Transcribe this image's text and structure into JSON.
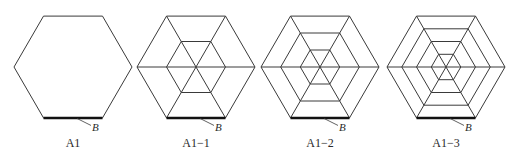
{
  "figure": {
    "panels": [
      {
        "id": "A1",
        "label": "A1",
        "cx": 73,
        "rings": 1,
        "edge_label": "B"
      },
      {
        "id": "A1-1",
        "label": "A1−1",
        "cx": 196,
        "rings": 2,
        "edge_label": "B"
      },
      {
        "id": "A1-2",
        "label": "A1−2",
        "cx": 320,
        "rings": 3,
        "edge_label": "B"
      },
      {
        "id": "A1-3",
        "label": "A1−3",
        "cx": 446,
        "rings": 4,
        "edge_label": "B"
      }
    ],
    "hexagon": {
      "radius": 59,
      "cy": 67,
      "spokes_except_first": true
    },
    "colors": {
      "line": "#3a3a3a",
      "highlight": "#111111",
      "background": "#ffffff"
    }
  }
}
